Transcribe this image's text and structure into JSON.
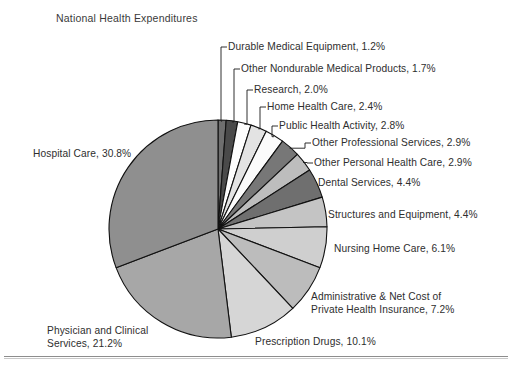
{
  "figure": {
    "title": "National Health Expenditures",
    "width": 512,
    "height": 372,
    "background": "#ffffff",
    "has_bottom_rule": true
  },
  "pie": {
    "center_x": 218,
    "center_y": 229,
    "radius": 109,
    "start_angle_deg": 0,
    "direction": "clockwise",
    "outline_color": "#111111",
    "outline_width": 1.1
  },
  "chart_data": {
    "type": "pie",
    "title": "National Health Expenditures",
    "xlabel": "",
    "ylabel": "",
    "units": "percent",
    "legend_position": "callout-labels",
    "grid": false,
    "total": 100.1,
    "categories": [
      "Durable Medical Equipment",
      "Other Nondurable Medical Products",
      "Research",
      "Home Health Care",
      "Public Health Activity",
      "Other Professional Services",
      "Other Personal Health Care",
      "Dental Services",
      "Structures and Equipment",
      "Nursing Home Care",
      "Administrative & Net Cost of Private Health Insurance",
      "Prescription Drugs",
      "Physician and Clinical Services",
      "Hospital Care"
    ],
    "values": [
      1.2,
      1.7,
      2.0,
      2.4,
      2.8,
      2.9,
      2.9,
      4.4,
      4.4,
      6.1,
      7.2,
      10.1,
      21.2,
      30.8
    ],
    "colors": [
      "#6e6e6e",
      "#4a4a4a",
      "#fdfdfd",
      "#e3e3e3",
      "#fbfbfb",
      "#777777",
      "#bdbdbd",
      "#6f6f6f",
      "#c4c4c4",
      "#cfcfcf",
      "#bcbcbc",
      "#d6d6d6",
      "#a7a7a7",
      "#8f8f8f"
    ],
    "slices": [
      {
        "label": "Durable Medical Equipment, 1.2%",
        "name": "Durable Medical Equipment",
        "value": 1.2,
        "color": "#6e6e6e"
      },
      {
        "label": "Other Nondurable Medical Products, 1.7%",
        "name": "Other Nondurable Medical Products",
        "value": 1.7,
        "color": "#4a4a4a"
      },
      {
        "label": "Research, 2.0%",
        "name": "Research",
        "value": 2.0,
        "color": "#fdfdfd"
      },
      {
        "label": "Home Health Care, 2.4%",
        "name": "Home Health Care",
        "value": 2.4,
        "color": "#e3e3e3"
      },
      {
        "label": "Public Health Activity, 2.8%",
        "name": "Public Health Activity",
        "value": 2.8,
        "color": "#fbfbfb"
      },
      {
        "label": "Other Professional Services, 2.9%",
        "name": "Other Professional Services",
        "value": 2.9,
        "color": "#777777"
      },
      {
        "label": "Other Personal Health Care, 2.9%",
        "name": "Other Personal Health Care",
        "value": 2.9,
        "color": "#bdbdbd"
      },
      {
        "label": "Dental Services, 4.4%",
        "name": "Dental Services",
        "value": 4.4,
        "color": "#6f6f6f"
      },
      {
        "label": "Structures and Equipment, 4.4%",
        "name": "Structures and Equipment",
        "value": 4.4,
        "color": "#c4c4c4"
      },
      {
        "label": "Nursing Home Care, 6.1%",
        "name": "Nursing Home Care",
        "value": 6.1,
        "color": "#cfcfcf"
      },
      {
        "label": "Administrative & Net Cost of Private Health Insurance, 7.2%",
        "name": "Administrative & Net Cost of Private Health Insurance",
        "value": 7.2,
        "color": "#bcbcbc"
      },
      {
        "label": "Prescription Drugs, 10.1%",
        "name": "Prescription Drugs",
        "value": 10.1,
        "color": "#d6d6d6"
      },
      {
        "label": "Physician and Clinical Services, 21.2%",
        "name": "Physician and Clinical Services",
        "value": 21.2,
        "color": "#a7a7a7"
      },
      {
        "label": "Hospital Care, 30.8%",
        "name": "Hospital Care",
        "value": 30.8,
        "color": "#8f8f8f"
      }
    ]
  },
  "callouts": [
    {
      "id": "durable-medical-equipment",
      "text": "Durable Medical Equipment, 1.2%",
      "x": 228,
      "y": 41,
      "line": true
    },
    {
      "id": "other-nondurable-medical-products",
      "text": "Other Nondurable Medical Products, 1.7%",
      "x": 241,
      "y": 63,
      "line": true
    },
    {
      "id": "research",
      "text": "Research, 2.0%",
      "x": 254,
      "y": 84,
      "line": true
    },
    {
      "id": "home-health-care",
      "text": "Home Health Care, 2.4%",
      "x": 267,
      "y": 101,
      "line": true
    },
    {
      "id": "public-health-activity",
      "text": "Public Health Activity, 2.8%",
      "x": 279,
      "y": 120,
      "line": true
    },
    {
      "id": "other-professional-services",
      "text": "Other Professional Services, 2.9%",
      "x": 312,
      "y": 137,
      "line": true
    },
    {
      "id": "other-personal-health-care",
      "text": "Other Personal Health Care, 2.9%",
      "x": 314,
      "y": 157,
      "line": true
    },
    {
      "id": "dental-services",
      "text": "Dental Services, 4.4%",
      "x": 318,
      "y": 177,
      "line": false
    },
    {
      "id": "structures-and-equipment",
      "text": "Structures and Equipment, 4.4%",
      "x": 328,
      "y": 209,
      "line": false
    },
    {
      "id": "nursing-home-care",
      "text": "Nursing Home Care, 6.1%",
      "x": 334,
      "y": 243,
      "line": false
    },
    {
      "id": "administrative-net-cost",
      "text": "Administrative & Net Cost of Private Health Insurance, 7.2%",
      "x": 311,
      "y": 291,
      "line": false,
      "two_line": true,
      "line1": "Administrative & Net Cost of",
      "line2": "Private Health Insurance, 7.2%"
    },
    {
      "id": "prescription-drugs",
      "text": "Prescription Drugs, 10.1%",
      "x": 255,
      "y": 336,
      "line": false
    },
    {
      "id": "physician-and-clinical-services",
      "text": "Physician and Clinical Services, 21.2%",
      "x": 47,
      "y": 325,
      "line": false,
      "two_line": true,
      "line1": "Physician and Clinical",
      "line2": "Services, 21.2%"
    },
    {
      "id": "hospital-care",
      "text": "Hospital Care, 30.8%",
      "x": 33,
      "y": 148,
      "line": false
    }
  ]
}
